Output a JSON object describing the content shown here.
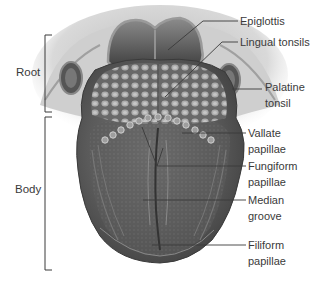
{
  "figure": {
    "caption_fragment": "Figure: The tongue — dorsal surface (caption cropped at top edge)"
  },
  "regions": [
    {
      "id": "root",
      "label": "Root"
    },
    {
      "id": "body",
      "label": "Body"
    }
  ],
  "labels": [
    {
      "id": "epiglottis",
      "lines": [
        "Epiglottis"
      ]
    },
    {
      "id": "lingual-tonsils",
      "lines": [
        "Lingual tonsils"
      ]
    },
    {
      "id": "palatine-tonsil",
      "lines": [
        "Palatine",
        "tonsil"
      ]
    },
    {
      "id": "vallate-papillae",
      "lines": [
        "Vallate",
        "papillae"
      ]
    },
    {
      "id": "fungiform-papillae",
      "lines": [
        "Fungiform",
        "papillae"
      ]
    },
    {
      "id": "median-groove",
      "lines": [
        "Median",
        "groove"
      ]
    },
    {
      "id": "filiform-papillae",
      "lines": [
        "Filiform",
        "papillae"
      ]
    }
  ],
  "colors": {
    "line": "#3a3a3a",
    "tissue_dark": "#4a4a4a",
    "tissue_mid": "#6e6e6e",
    "tissue_light": "#a8a8a8",
    "surround": "#d6d6d6"
  }
}
